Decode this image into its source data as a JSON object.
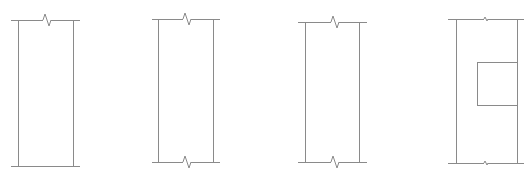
{
  "diagram": {
    "type": "panel-elevations",
    "stroke_color": "#8a8a8a",
    "background": "#ffffff",
    "panels": [
      {
        "id": "panel-1",
        "top_y": 20,
        "bottom_y": 166,
        "edge_left": 11,
        "edge_right": 80,
        "side_left": 18,
        "side_right": 73,
        "breaks": [
          {
            "position": "top",
            "x": 47
          }
        ],
        "opening": null
      },
      {
        "id": "panel-2",
        "top_y": 19,
        "bottom_y": 162,
        "edge_left": 152,
        "edge_right": 220,
        "side_left": 158,
        "side_right": 213,
        "breaks": [
          {
            "position": "top",
            "x": 187
          },
          {
            "position": "bottom",
            "x": 187
          }
        ],
        "opening": null
      },
      {
        "id": "panel-3",
        "top_y": 22,
        "bottom_y": 162,
        "edge_left": 298,
        "edge_right": 367,
        "side_left": 305,
        "side_right": 359,
        "breaks": [
          {
            "position": "top",
            "x": 335
          },
          {
            "position": "bottom",
            "x": 335
          }
        ],
        "opening": null
      },
      {
        "id": "panel-4",
        "top_y": 19,
        "bottom_y": 163,
        "edge_left": 448,
        "edge_right": 524,
        "side_left": 456,
        "side_right": 517,
        "breaks": [
          {
            "position": "top",
            "x": 486,
            "small": true
          },
          {
            "position": "bottom",
            "x": 486,
            "small": true
          }
        ],
        "opening": {
          "x": 477,
          "y": 62,
          "width": 40,
          "height": 43
        }
      }
    ]
  }
}
